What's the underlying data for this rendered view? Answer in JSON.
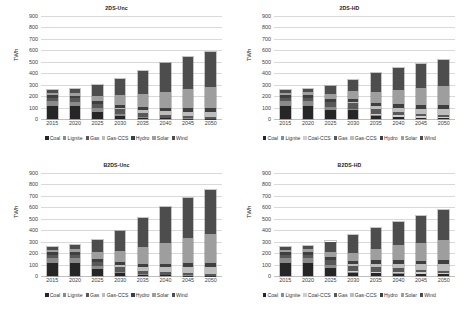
{
  "figure": {
    "panel_count": 4,
    "y_axis_title": "TWh",
    "y_ticks": [
      "900",
      "800",
      "700",
      "600",
      "500",
      "400",
      "300",
      "200",
      "100",
      "0"
    ],
    "x_ticks": [
      "2015",
      "2020",
      "2025",
      "2030",
      "2035",
      "2040",
      "2045",
      "2050"
    ],
    "ylim": [
      0,
      900
    ],
    "colors": {
      "Coal": "#262626",
      "Lignite": "#8a8a8a",
      "Coal-CCS": "#cfcfcf",
      "Gas": "#585858",
      "Gas-CCS": "#bdbdbd",
      "Hydro": "#3f3f3f",
      "Solar": "#9e9e9e",
      "Wind": "#4d4d4d"
    }
  },
  "chart_data": [
    {
      "type": "bar",
      "stacked": true,
      "title": "2DS-Unc",
      "xlabel": "",
      "ylabel": "TWh",
      "ylim": [
        0,
        900
      ],
      "grid": true,
      "legend_position": "bottom",
      "categories": [
        "2015",
        "2020",
        "2025",
        "2030",
        "2035",
        "2040",
        "2045",
        "2050"
      ],
      "series": [
        {
          "name": "Coal",
          "values": [
            118,
            115,
            60,
            25,
            10,
            5,
            3,
            2
          ]
        },
        {
          "name": "Lignite",
          "values": [
            40,
            38,
            32,
            18,
            10,
            5,
            3,
            2
          ]
        },
        {
          "name": "Gas",
          "values": [
            28,
            30,
            38,
            45,
            30,
            22,
            18,
            15
          ]
        },
        {
          "name": "Gas-CCS",
          "values": [
            0,
            0,
            0,
            12,
            30,
            38,
            42,
            45
          ]
        },
        {
          "name": "Hydro",
          "values": [
            22,
            22,
            24,
            26,
            28,
            30,
            32,
            34
          ]
        },
        {
          "name": "Solar",
          "values": [
            18,
            22,
            48,
            80,
            110,
            140,
            165,
            180
          ]
        },
        {
          "name": "Wind",
          "values": [
            26,
            35,
            96,
            144,
            202,
            250,
            282,
            307
          ]
        }
      ],
      "totals": [
        252,
        262,
        298,
        350,
        420,
        490,
        545,
        585
      ],
      "legend": [
        "Coal",
        "Lignite",
        "Gas",
        "Gas-CCS",
        "Hydro",
        "Solar",
        "Wind"
      ]
    },
    {
      "type": "bar",
      "stacked": true,
      "title": "2DS-HD",
      "xlabel": "",
      "ylabel": "TWh",
      "ylim": [
        0,
        900
      ],
      "grid": true,
      "legend_position": "bottom",
      "categories": [
        "2015",
        "2020",
        "2025",
        "2030",
        "2035",
        "2040",
        "2045",
        "2050"
      ],
      "series": [
        {
          "name": "Coal",
          "values": [
            118,
            118,
            78,
            80,
            28,
            18,
            8,
            6
          ]
        },
        {
          "name": "Lignite",
          "values": [
            40,
            38,
            30,
            12,
            8,
            4,
            3,
            2
          ]
        },
        {
          "name": "Coal-CCS",
          "values": [
            0,
            0,
            0,
            0,
            8,
            10,
            12,
            12
          ]
        },
        {
          "name": "Gas",
          "values": [
            30,
            32,
            44,
            48,
            40,
            30,
            22,
            18
          ]
        },
        {
          "name": "Gas-CCS",
          "values": [
            0,
            0,
            0,
            10,
            26,
            36,
            44,
            48
          ]
        },
        {
          "name": "Hydro",
          "values": [
            22,
            22,
            24,
            26,
            28,
            30,
            32,
            34
          ]
        },
        {
          "name": "Solar",
          "values": [
            18,
            22,
            42,
            66,
            96,
            124,
            152,
            168
          ]
        },
        {
          "name": "Wind",
          "values": [
            24,
            28,
            74,
            103,
            168,
            198,
            212,
            232
          ]
        }
      ],
      "totals": [
        252,
        260,
        292,
        345,
        402,
        450,
        485,
        520
      ],
      "legend": [
        "Coal",
        "Lignite",
        "Coal-CCS",
        "Gas",
        "Gas-CCS",
        "Hydro",
        "Solar",
        "Wind"
      ]
    },
    {
      "type": "bar",
      "stacked": true,
      "title": "B2DS-Unc",
      "xlabel": "",
      "ylabel": "TWh",
      "ylim": [
        0,
        900
      ],
      "grid": true,
      "legend_position": "bottom",
      "categories": [
        "2015",
        "2020",
        "2025",
        "2030",
        "2035",
        "2040",
        "2045",
        "2050"
      ],
      "series": [
        {
          "name": "Coal",
          "values": [
            118,
            118,
            58,
            22,
            8,
            5,
            3,
            2
          ]
        },
        {
          "name": "Lignite",
          "values": [
            40,
            38,
            28,
            10,
            6,
            4,
            3,
            2
          ]
        },
        {
          "name": "Gas",
          "values": [
            28,
            30,
            40,
            50,
            32,
            24,
            20,
            16
          ]
        },
        {
          "name": "Gas-CCS",
          "values": [
            0,
            0,
            0,
            14,
            34,
            44,
            54,
            62
          ]
        },
        {
          "name": "Hydro",
          "values": [
            22,
            22,
            24,
            26,
            28,
            30,
            32,
            34
          ]
        },
        {
          "name": "Solar",
          "values": [
            18,
            24,
            58,
            98,
            142,
            182,
            218,
            248
          ]
        },
        {
          "name": "Wind",
          "values": [
            26,
            38,
            110,
            175,
            255,
            311,
            355,
            386
          ]
        }
      ],
      "totals": [
        252,
        270,
        318,
        395,
        505,
        600,
        685,
        750
      ],
      "legend": [
        "Coal",
        "Lignite",
        "Gas",
        "Gas-CCS",
        "Hydro",
        "Solar",
        "Wind"
      ]
    },
    {
      "type": "bar",
      "stacked": true,
      "title": "B2DS-HD",
      "xlabel": "",
      "ylabel": "TWh",
      "ylim": [
        0,
        900
      ],
      "grid": true,
      "legend_position": "bottom",
      "categories": [
        "2015",
        "2020",
        "2025",
        "2030",
        "2035",
        "2040",
        "2045",
        "2050"
      ],
      "series": [
        {
          "name": "Coal",
          "values": [
            118,
            118,
            72,
            22,
            22,
            20,
            16,
            14
          ]
        },
        {
          "name": "Lignite",
          "values": [
            40,
            38,
            26,
            10,
            6,
            4,
            3,
            2
          ]
        },
        {
          "name": "Coal-CCS",
          "values": [
            0,
            0,
            0,
            8,
            10,
            12,
            12,
            12
          ]
        },
        {
          "name": "Gas",
          "values": [
            30,
            32,
            46,
            52,
            42,
            32,
            24,
            20
          ]
        },
        {
          "name": "Gas-CCS",
          "values": [
            0,
            0,
            0,
            12,
            28,
            40,
            48,
            54
          ]
        },
        {
          "name": "Hydro",
          "values": [
            22,
            22,
            24,
            26,
            28,
            30,
            32,
            34
          ]
        },
        {
          "name": "Solar",
          "values": [
            18,
            22,
            44,
            70,
            102,
            132,
            158,
            178
          ]
        },
        {
          "name": "Wind",
          "values": [
            24,
            28,
            90,
            155,
            182,
            200,
            232,
            266
          ]
        }
      ],
      "totals": [
        252,
        260,
        302,
        355,
        420,
        470,
        525,
        580
      ],
      "legend": [
        "Coal",
        "Lignite",
        "Coal-CCS",
        "Gas",
        "Gas-CCS",
        "Hydro",
        "Solar",
        "Wind"
      ]
    }
  ]
}
